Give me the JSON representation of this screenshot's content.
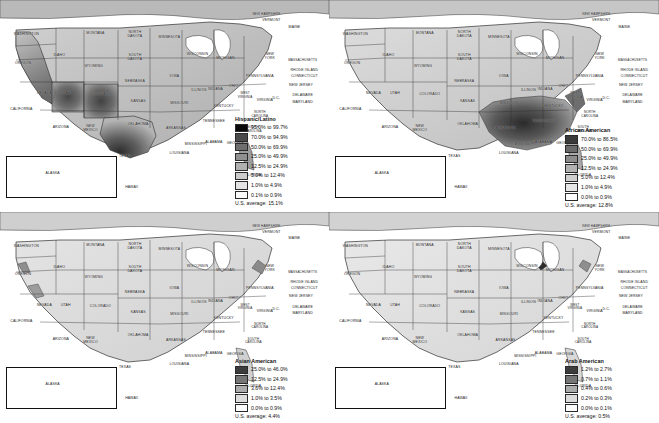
{
  "figure": {
    "type": "map-grid",
    "panel_count": 4,
    "projection_note": "contiguous United States with Alaska and Hawaii inset"
  },
  "state_labels": [
    {
      "name": "WASHINGTON",
      "x": 8.0,
      "y": 16.5
    },
    {
      "name": "OREGON",
      "x": 7.0,
      "y": 30.0
    },
    {
      "name": "CALIFORNIA",
      "x": 6.5,
      "y": 52.0
    },
    {
      "name": "NEVADA",
      "x": 13.5,
      "y": 44.5
    },
    {
      "name": "IDAHO",
      "x": 18.0,
      "y": 26.5
    },
    {
      "name": "MONTANA",
      "x": 29.0,
      "y": 16.0
    },
    {
      "name": "WYOMING",
      "x": 28.5,
      "y": 31.5
    },
    {
      "name": "UTAH",
      "x": 20.0,
      "y": 44.5
    },
    {
      "name": "ARIZONA",
      "x": 18.5,
      "y": 60.5
    },
    {
      "name": "COLORADO",
      "x": 30.5,
      "y": 45.0
    },
    {
      "name": "NEW\nMEXICO",
      "x": 27.5,
      "y": 61.0
    },
    {
      "name": "NORTH\nDAKOTA",
      "x": 41.0,
      "y": 16.5
    },
    {
      "name": "SOUTH\nDAKOTA",
      "x": 41.0,
      "y": 27.5
    },
    {
      "name": "NEBRASKA",
      "x": 41.0,
      "y": 38.5
    },
    {
      "name": "KANSAS",
      "x": 42.0,
      "y": 48.0
    },
    {
      "name": "OKLAHOMA",
      "x": 42.0,
      "y": 59.0
    },
    {
      "name": "TEXAS",
      "x": 38.0,
      "y": 74.0
    },
    {
      "name": "MINNESOTA",
      "x": 51.5,
      "y": 18.0
    },
    {
      "name": "IOWA",
      "x": 53.0,
      "y": 36.5
    },
    {
      "name": "MISSOURI",
      "x": 54.5,
      "y": 49.0
    },
    {
      "name": "ARKANSAS",
      "x": 53.5,
      "y": 61.0
    },
    {
      "name": "LOUISIANA",
      "x": 54.5,
      "y": 72.5
    },
    {
      "name": "WISCONSIN",
      "x": 60.0,
      "y": 26.0
    },
    {
      "name": "ILLINOIS",
      "x": 60.5,
      "y": 43.0
    },
    {
      "name": "MISSISSIPPI",
      "x": 59.5,
      "y": 68.5
    },
    {
      "name": "MICHIGAN",
      "x": 68.5,
      "y": 28.0
    },
    {
      "name": "INDIANA",
      "x": 65.5,
      "y": 42.5
    },
    {
      "name": "OHIO",
      "x": 71.0,
      "y": 41.0
    },
    {
      "name": "KENTUCKY",
      "x": 68.0,
      "y": 50.5
    },
    {
      "name": "TENNESSEE",
      "x": 65.0,
      "y": 57.5
    },
    {
      "name": "ALABAMA",
      "x": 65.0,
      "y": 67.5
    },
    {
      "name": "GEORGIA",
      "x": 71.5,
      "y": 68.0
    },
    {
      "name": "FLORIDA",
      "x": 77.0,
      "y": 83.0
    },
    {
      "name": "SOUTH\nCAROLINA",
      "x": 77.0,
      "y": 61.0
    },
    {
      "name": "NORTH\nCAROLINA",
      "x": 79.0,
      "y": 54.0
    },
    {
      "name": "VIRGINIA",
      "x": 80.5,
      "y": 47.5
    },
    {
      "name": "WEST\nVIRGINIA",
      "x": 74.5,
      "y": 45.0
    },
    {
      "name": "PENNSYLVANIA",
      "x": 79.0,
      "y": 36.5
    },
    {
      "name": "NEW\nYORK",
      "x": 82.0,
      "y": 27.0
    },
    {
      "name": "MAINE",
      "x": 89.5,
      "y": 13.0
    },
    {
      "name": "NEW HAMPSHIRE",
      "x": 81.0,
      "y": 7.0
    },
    {
      "name": "VERMONT",
      "x": 82.5,
      "y": 10.0
    },
    {
      "name": "MASSACHUSETTS",
      "x": 92.0,
      "y": 29.0
    },
    {
      "name": "RHODE ISLAND",
      "x": 92.5,
      "y": 33.5
    },
    {
      "name": "CONNECTICUT",
      "x": 92.5,
      "y": 36.5
    },
    {
      "name": "NEW JERSEY",
      "x": 91.5,
      "y": 40.5
    },
    {
      "name": "DELAWARE",
      "x": 92.0,
      "y": 45.5
    },
    {
      "name": "MARYLAND",
      "x": 92.0,
      "y": 48.5
    },
    {
      "name": "D.C.",
      "x": 84.0,
      "y": 46.5
    },
    {
      "name": "ALASKA",
      "x": 16.0,
      "y": 82.0
    },
    {
      "name": "HAWAII",
      "x": 40.0,
      "y": 88.5
    }
  ],
  "panels": [
    {
      "id": "hispanic-latino",
      "legend": {
        "title": "Hispanic/Latino",
        "average_label": "U.S. average:  15.1%",
        "classes": [
          {
            "label": "95.0% to 99.7%",
            "color": "#0a0a0a"
          },
          {
            "label": "70.0% to 94.9%",
            "color": "#4a4a4a"
          },
          {
            "label": "50.0% to 69.9%",
            "color": "#6e6e6e"
          },
          {
            "label": "25.0% to 49.9%",
            "color": "#909090"
          },
          {
            "label": "12.5% to 24.9%",
            "color": "#b0b0b0"
          },
          {
            "label": "5.0% to 12.4%",
            "color": "#cccccc"
          },
          {
            "label": "1.0% to 4.9%",
            "color": "#e3e3e3"
          },
          {
            "label": "0.1% to 0.9%",
            "color": "#fbfbfb"
          }
        ]
      }
    },
    {
      "id": "african-american",
      "legend": {
        "title": "African American",
        "average_label": "U.S. average:  12.8%",
        "classes": [
          {
            "label": "70.0% to 86.5%",
            "color": "#3a3a3a"
          },
          {
            "label": "50.0% to 69.9%",
            "color": "#6a6a6a"
          },
          {
            "label": "25.0% to 49.9%",
            "color": "#8d8d8d"
          },
          {
            "label": "12.5% to 24.9%",
            "color": "#b2b2b2"
          },
          {
            "label": "5.0% to 12.4%",
            "color": "#cfcfcf"
          },
          {
            "label": "1.0% to 4.9%",
            "color": "#e6e6e6"
          },
          {
            "label": "0.0% to 0.9%",
            "color": "#fcfcfc"
          }
        ]
      }
    },
    {
      "id": "asian-american",
      "legend": {
        "title": "Asian American",
        "average_label": "U.S. average:  4.4%",
        "classes": [
          {
            "label": "25.0% to 46.0%",
            "color": "#3c3c3c"
          },
          {
            "label": "12.5% to 24.9%",
            "color": "#767676"
          },
          {
            "label": "3.6% to 12.4%",
            "color": "#ababab"
          },
          {
            "label": "1.0% to 3.5%",
            "color": "#dcdcdc"
          },
          {
            "label": "0.0% to 0.9%",
            "color": "#fcfcfc"
          }
        ]
      }
    },
    {
      "id": "arab-american",
      "legend": {
        "title": "Arab American",
        "average_label": "U.S. average:  0.5%",
        "classes": [
          {
            "label": "1.2% to 2.7%",
            "color": "#3c3c3c"
          },
          {
            "label": "0.7% to 1.1%",
            "color": "#767676"
          },
          {
            "label": "0.4% to 0.6%",
            "color": "#ababab"
          },
          {
            "label": "0.2% to 0.3%",
            "color": "#dcdcdc"
          },
          {
            "label": "0.0% to 0.1%",
            "color": "#fcfcfc"
          }
        ]
      }
    }
  ],
  "chart_data": {
    "type": "heatmap",
    "title": "",
    "maps": [
      {
        "name": "Hispanic/Latino",
        "us_average_percent": 15.1,
        "bins": [
          {
            "range": [
              95.0,
              99.7
            ],
            "shade": "#0a0a0a"
          },
          {
            "range": [
              70.0,
              94.9
            ],
            "shade": "#4a4a4a"
          },
          {
            "range": [
              50.0,
              69.9
            ],
            "shade": "#6e6e6e"
          },
          {
            "range": [
              25.0,
              49.9
            ],
            "shade": "#909090"
          },
          {
            "range": [
              12.5,
              24.9
            ],
            "shade": "#b0b0b0"
          },
          {
            "range": [
              5.0,
              12.4
            ],
            "shade": "#cccccc"
          },
          {
            "range": [
              1.0,
              4.9
            ],
            "shade": "#e3e3e3"
          },
          {
            "range": [
              0.1,
              0.9
            ],
            "shade": "#fbfbfb"
          }
        ],
        "high_density_regions": [
          "New Mexico",
          "South Texas",
          "Southern California",
          "Arizona",
          "South Florida"
        ]
      },
      {
        "name": "African American",
        "us_average_percent": 12.8,
        "bins": [
          {
            "range": [
              70.0,
              86.5
            ],
            "shade": "#3a3a3a"
          },
          {
            "range": [
              50.0,
              69.9
            ],
            "shade": "#6a6a6a"
          },
          {
            "range": [
              25.0,
              49.9
            ],
            "shade": "#8d8d8d"
          },
          {
            "range": [
              12.5,
              24.9
            ],
            "shade": "#b2b2b2"
          },
          {
            "range": [
              5.0,
              12.4
            ],
            "shade": "#cfcfcf"
          },
          {
            "range": [
              1.0,
              4.9
            ],
            "shade": "#e6e6e6"
          },
          {
            "range": [
              0.0,
              0.9
            ],
            "shade": "#fcfcfc"
          }
        ],
        "high_density_regions": [
          "Mississippi Delta",
          "Alabama Black Belt",
          "Georgia",
          "South Carolina",
          "Eastern Virginia"
        ]
      },
      {
        "name": "Asian American",
        "us_average_percent": 4.4,
        "bins": [
          {
            "range": [
              25.0,
              46.0
            ],
            "shade": "#3c3c3c"
          },
          {
            "range": [
              12.5,
              24.9
            ],
            "shade": "#767676"
          },
          {
            "range": [
              3.6,
              12.4
            ],
            "shade": "#ababab"
          },
          {
            "range": [
              1.0,
              3.5
            ],
            "shade": "#dcdcdc"
          },
          {
            "range": [
              0.0,
              0.9
            ],
            "shade": "#fcfcfc"
          }
        ],
        "high_density_regions": [
          "Hawaii",
          "San Francisco Bay Area",
          "Los Angeles",
          "New York City"
        ]
      },
      {
        "name": "Arab American",
        "us_average_percent": 0.5,
        "bins": [
          {
            "range": [
              1.2,
              2.7
            ],
            "shade": "#3c3c3c"
          },
          {
            "range": [
              0.7,
              1.1
            ],
            "shade": "#767676"
          },
          {
            "range": [
              0.4,
              0.6
            ],
            "shade": "#ababab"
          },
          {
            "range": [
              0.2,
              0.3
            ],
            "shade": "#dcdcdc"
          },
          {
            "range": [
              0.0,
              0.1
            ],
            "shade": "#fcfcfc"
          }
        ],
        "high_density_regions": [
          "Detroit Michigan",
          "Northern New Jersey",
          "Chicago"
        ]
      }
    ]
  }
}
